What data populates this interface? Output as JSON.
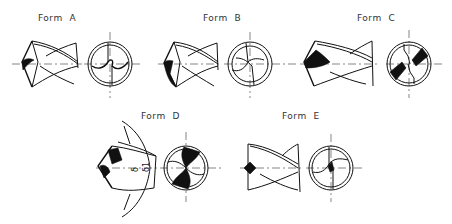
{
  "figure": {
    "forms": [
      {
        "id": "A",
        "label": "Form  A"
      },
      {
        "id": "B",
        "label": "Form  B"
      },
      {
        "id": "C",
        "label": "Form  C"
      },
      {
        "id": "D",
        "label": "Form  D"
      },
      {
        "id": "E",
        "label": "Form  E"
      }
    ],
    "symbols": {
      "angle_delta": "δ",
      "angle_delta1": "δ1"
    }
  }
}
